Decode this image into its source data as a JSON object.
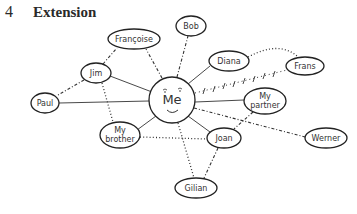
{
  "heading": {
    "number": "4",
    "title": "Extension"
  },
  "diagram": {
    "center": {
      "id": "me",
      "label": "Me",
      "face": "smiley"
    },
    "nodes": [
      {
        "id": "francoise",
        "label": "Françoise"
      },
      {
        "id": "bob",
        "label": "Bob"
      },
      {
        "id": "jim",
        "label": "Jim"
      },
      {
        "id": "diana",
        "label": "Diana"
      },
      {
        "id": "frans",
        "label": "Frans"
      },
      {
        "id": "paul",
        "label": "Paul"
      },
      {
        "id": "my-partner",
        "label_line1": "My",
        "label_line2": "partner"
      },
      {
        "id": "my-brother",
        "label_line1": "My",
        "label_line2": "brother"
      },
      {
        "id": "joan",
        "label": "Joan"
      },
      {
        "id": "werner",
        "label": "Werner"
      },
      {
        "id": "gilian",
        "label": "Gilian"
      }
    ],
    "edges": [
      {
        "from": "me",
        "to": "jim",
        "style": "solid"
      },
      {
        "from": "me",
        "to": "paul",
        "style": "solid"
      },
      {
        "from": "me",
        "to": "diana",
        "style": "solid"
      },
      {
        "from": "me",
        "to": "my-partner",
        "style": "solid"
      },
      {
        "from": "me",
        "to": "my-brother",
        "style": "solid"
      },
      {
        "from": "me",
        "to": "joan",
        "style": "solid"
      },
      {
        "from": "me",
        "to": "francoise",
        "style": "dash-dot"
      },
      {
        "from": "me",
        "to": "bob",
        "style": "dash-dot"
      },
      {
        "from": "me",
        "to": "werner",
        "style": "dash-dot"
      },
      {
        "from": "me",
        "to": "frans",
        "style": "cross"
      },
      {
        "from": "me",
        "to": "gilian",
        "style": "dotted"
      },
      {
        "from": "jim",
        "to": "francoise",
        "style": "dash-dot"
      },
      {
        "from": "jim",
        "to": "paul",
        "style": "dash-dot"
      },
      {
        "from": "jim",
        "to": "my-brother",
        "style": "dotted"
      },
      {
        "from": "diana",
        "to": "frans",
        "style": "dotted"
      },
      {
        "from": "my-partner",
        "to": "joan",
        "style": "dash-dot"
      },
      {
        "from": "my-brother",
        "to": "joan",
        "style": "dotted"
      },
      {
        "from": "joan",
        "to": "gilian",
        "style": "dash-dot"
      }
    ]
  }
}
